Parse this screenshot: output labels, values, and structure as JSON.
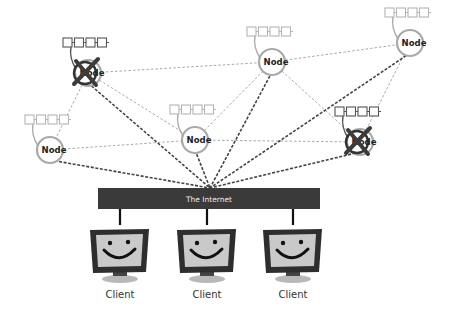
{
  "diagram": {
    "internet": {
      "label": "The Internet",
      "x": 98,
      "y": 188,
      "w": 222,
      "h": 21,
      "color": "#3a3a3a"
    },
    "nodes": [
      {
        "id": "n1",
        "label": "Node",
        "cx": 88,
        "cy": 73,
        "failed": true
      },
      {
        "id": "n2",
        "label": "Node",
        "cx": 272,
        "cy": 62,
        "failed": false
      },
      {
        "id": "n3",
        "label": "Node",
        "cx": 410,
        "cy": 43,
        "failed": false
      },
      {
        "id": "n4",
        "label": "Node",
        "cx": 50,
        "cy": 150,
        "failed": false
      },
      {
        "id": "n5",
        "label": "Node",
        "cx": 195,
        "cy": 140,
        "failed": false
      },
      {
        "id": "n6",
        "label": "Node",
        "cx": 360,
        "cy": 142,
        "failed": true
      }
    ],
    "clients": [
      {
        "label": "Client",
        "cx": 120
      },
      {
        "label": "Client",
        "cx": 207
      },
      {
        "label": "Client",
        "cx": 293
      }
    ],
    "peer_links": [
      [
        "n1",
        "n2"
      ],
      [
        "n2",
        "n3"
      ],
      [
        "n1",
        "n4"
      ],
      [
        "n1",
        "n5"
      ],
      [
        "n4",
        "n5"
      ],
      [
        "n5",
        "n2"
      ],
      [
        "n2",
        "n6"
      ],
      [
        "n3",
        "n6"
      ],
      [
        "n5",
        "n6"
      ]
    ],
    "internet_links": [
      "n1",
      "n2",
      "n3",
      "n4",
      "n5",
      "n6"
    ],
    "colors": {
      "peer_link": "#a8a8a8",
      "internet_link": "#444444",
      "node_ring": "#a9a9a9",
      "queue_normal": "#b5b5b5",
      "queue_failed": "#555555",
      "failed_cross": "#3c3c3c",
      "monitor_frame": "#2e2e2e",
      "monitor_screen": "#c9c9c9",
      "monitor_stand": "#9a9a9a"
    }
  }
}
